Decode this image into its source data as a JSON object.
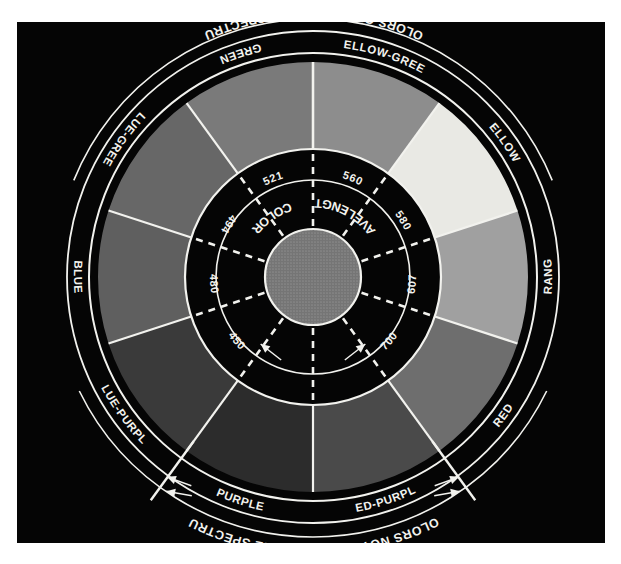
{
  "figure": {
    "type": "color-wheel-diagram",
    "background": "#050505",
    "hub_color": "#7c7c7c",
    "line_color": "#f2f2ee",
    "band_color": "#050505"
  },
  "captions": {
    "top_arc": "COLORS ON THE VISIBLE SPECTRUM",
    "bottom_arc": "COLORS NOT FOUND ON THE SPECTRUM"
  },
  "band_labels": {
    "left": "COLOR",
    "right": "WAVELENGTH"
  },
  "segments": [
    {
      "label": "YELLOW-GREEN",
      "color": "#8d8d8d",
      "start_deg": -90,
      "end_deg": -54
    },
    {
      "label": "YELLOW",
      "color": "#e9e9e4",
      "start_deg": -54,
      "end_deg": -18
    },
    {
      "label": "ORANGE",
      "color": "#a0a0a0",
      "start_deg": -18,
      "end_deg": 18
    },
    {
      "label": "RED",
      "color": "#6e6e6e",
      "start_deg": 18,
      "end_deg": 54
    },
    {
      "label": "RED-PURPLE",
      "color": "#4a4a4a",
      "start_deg": 54,
      "end_deg": 90
    },
    {
      "label": "PURPLE",
      "color": "#2c2c2c",
      "start_deg": 90,
      "end_deg": 126
    },
    {
      "label": "BLUE-PURPLE",
      "color": "#3a3a3a",
      "start_deg": 126,
      "end_deg": 162
    },
    {
      "label": "BLUE",
      "color": "#5f5f5f",
      "start_deg": 162,
      "end_deg": 198
    },
    {
      "label": "BLUE-GREEN",
      "color": "#676767",
      "start_deg": 198,
      "end_deg": 234
    },
    {
      "label": "GREEN",
      "color": "#7a7a7a",
      "start_deg": 234,
      "end_deg": 270
    }
  ],
  "wavelengths": [
    {
      "value": "521",
      "angle_deg": -112
    },
    {
      "value": "560",
      "angle_deg": -68
    },
    {
      "value": "580",
      "angle_deg": -32
    },
    {
      "value": "607",
      "angle_deg": 4
    },
    {
      "value": "700",
      "angle_deg": 40
    },
    {
      "value": "450",
      "angle_deg": 140
    },
    {
      "value": "480",
      "angle_deg": 176
    },
    {
      "value": "494",
      "angle_deg": 212
    }
  ],
  "chart_data": {
    "type": "pie",
    "categories": [
      "YELLOW-GREEN",
      "YELLOW",
      "ORANGE",
      "RED",
      "RED-PURPLE",
      "PURPLE",
      "BLUE-PURPLE",
      "BLUE",
      "BLUE-GREEN",
      "GREEN"
    ],
    "values": [
      36,
      36,
      36,
      36,
      36,
      36,
      36,
      36,
      36,
      36
    ],
    "annotations": [
      "521",
      "560",
      "580",
      "607",
      "700",
      "450",
      "480",
      "494"
    ],
    "xlabel": "",
    "ylabel": ""
  }
}
